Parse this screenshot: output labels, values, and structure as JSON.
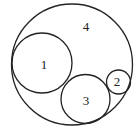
{
  "diagram": {
    "type": "nested-circles",
    "stroke_color": "#222222",
    "background": "#ffffff",
    "circles": [
      {
        "id": "4",
        "label": "4",
        "cx": 72,
        "cy": 64.5,
        "r": 60.5,
        "label_x": 86,
        "label_y": 31
      },
      {
        "id": "1",
        "label": "1",
        "cx": 42,
        "cy": 63,
        "r": 30,
        "label_x": 44,
        "label_y": 69
      },
      {
        "id": "3",
        "label": "3",
        "cx": 85.5,
        "cy": 99,
        "r": 24.5,
        "label_x": 86,
        "label_y": 105
      },
      {
        "id": "2",
        "label": "2",
        "cx": 118.5,
        "cy": 82,
        "r": 12,
        "label_x": 117,
        "label_y": 86
      }
    ]
  }
}
